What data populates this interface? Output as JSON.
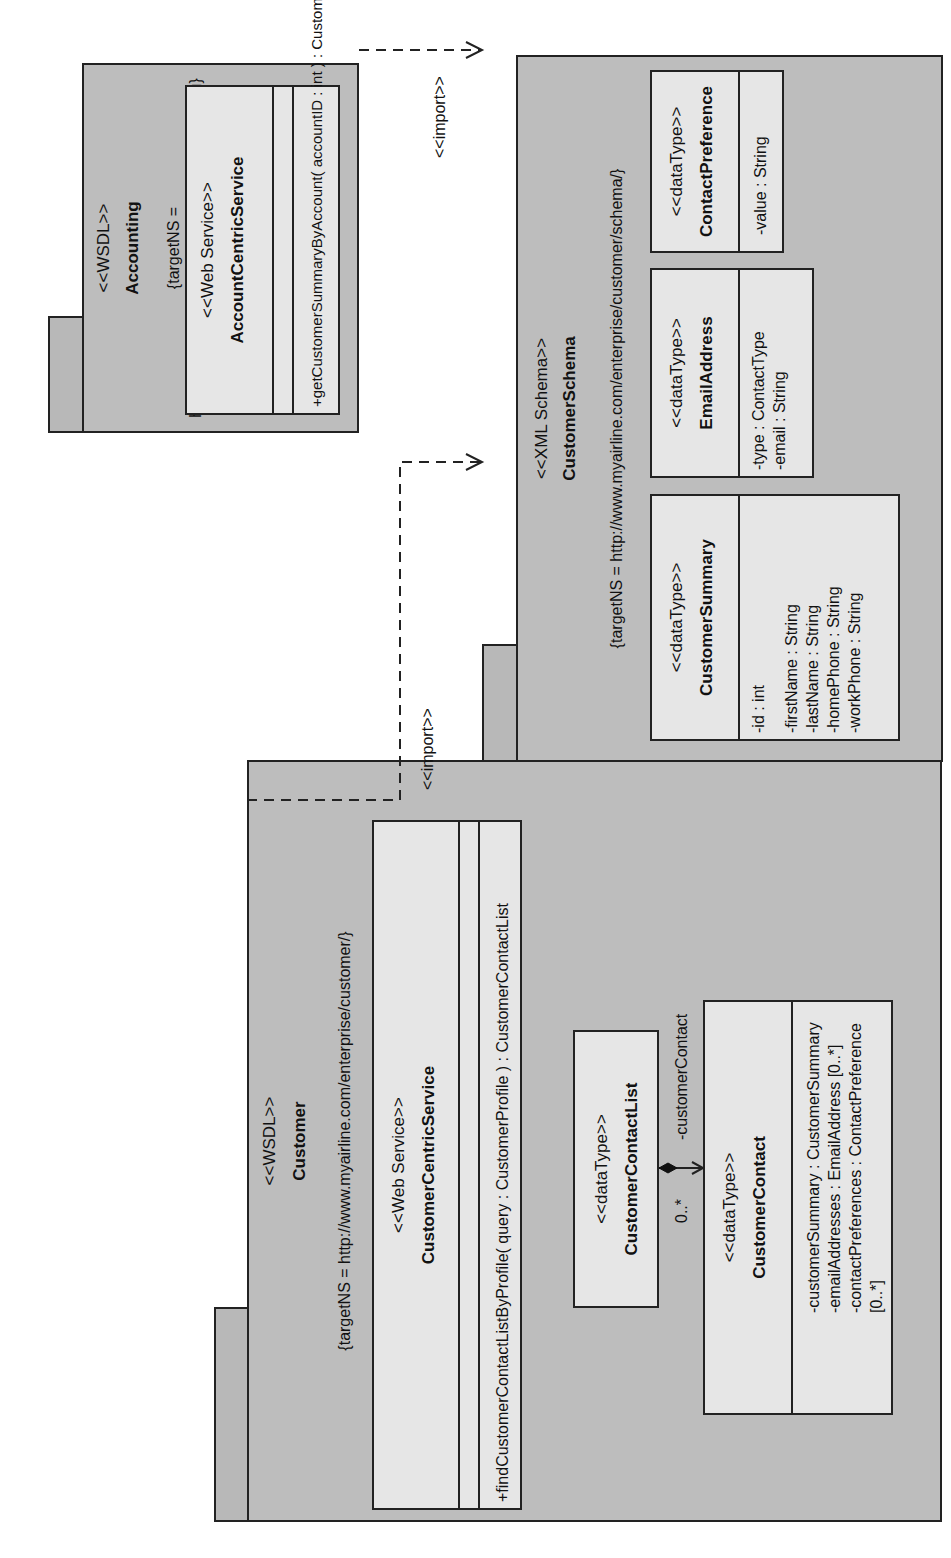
{
  "diagram": {
    "orientation": "rotated 90 degrees counter-clockwise",
    "packages": {
      "accounting": {
        "stereotype": "<<WSDL>>",
        "name": "Accounting",
        "target_ns": "{targetNS = http://www.myairline.com/enterprise/accounting}",
        "service": {
          "stereotype": "<<Web Service>>",
          "name": "AccountCentricService",
          "operations": [
            "+getCustomerSummaryByAccount( accountID : int ) : CustomerSummary"
          ]
        }
      },
      "customer_schema": {
        "stereotype": "<<XML Schema>>",
        "name": "CustomerSchema",
        "target_ns": "{targetNS = http://www.myairline.com/enterprise/customer/schema/}",
        "types": [
          {
            "stereotype": "<<dataType>>",
            "name": "CustomerSummary",
            "attributes": [
              "-id : int",
              "-firstName : String",
              "-lastName : String",
              "-homePhone : String",
              "-workPhone : String"
            ]
          },
          {
            "stereotype": "<<dataType>>",
            "name": "EmailAddress",
            "attributes": [
              "-type : ContactType",
              "-email : String"
            ]
          },
          {
            "stereotype": "<<dataType>>",
            "name": "ContactPreference",
            "attributes": [
              "-value : String"
            ]
          }
        ]
      },
      "customer": {
        "stereotype": "<<WSDL>>",
        "name": "Customer",
        "target_ns": "{targetNS = http://www.myairline.com/enterprise/customer/}",
        "service": {
          "stereotype": "<<Web Service>>",
          "name": "CustomerCentricService",
          "operations": [
            "+findCustomerContactListByProfile( query : CustomerProfile ) : CustomerContactList"
          ]
        },
        "types": [
          {
            "stereotype": "<<dataType>>",
            "name": "CustomerContactList"
          },
          {
            "stereotype": "<<dataType>>",
            "name": "CustomerContact",
            "attributes": [
              "-customerSummary : CustomerSummary",
              "-emailAddresses : EmailAddress [0..*]",
              "-contactPreferences : ContactPreference [0..*]"
            ]
          }
        ]
      }
    },
    "relationships": {
      "import_accounting": {
        "label": "<<import>>",
        "from": "Accounting",
        "to": "CustomerSchema",
        "style": "dashed arrow"
      },
      "import_customer": {
        "label": "<<import>>",
        "from": "Customer",
        "to": "CustomerSchema",
        "style": "dashed arrow"
      },
      "composition": {
        "from": "CustomerContactList",
        "to": "CustomerContact",
        "role": "-customerContact",
        "multiplicity": "0..*"
      }
    },
    "colors": {
      "package_fill": "#bdbdbd",
      "class_fill": "#e6e6e6",
      "line": "#222222",
      "background": "#ffffff"
    }
  }
}
